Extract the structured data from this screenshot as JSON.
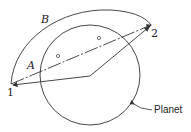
{
  "diagram": {
    "labels": {
      "path_a": "A",
      "path_b": "B",
      "point_1": "1",
      "point_2": "2",
      "planet": "Planet"
    },
    "colors": {
      "stroke": "#333333",
      "background": "#ffffff"
    },
    "geometry": {
      "planet_center": [
        90,
        75
      ],
      "planet_radius": 50,
      "point_1": [
        11,
        84
      ],
      "point_2": [
        151,
        25
      ],
      "center_vertex": [
        90,
        76
      ],
      "midpoint_markers": [
        [
          58,
          56
        ],
        [
          99,
          38
        ]
      ]
    }
  }
}
